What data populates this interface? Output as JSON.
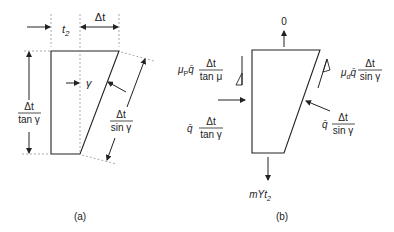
{
  "diagram": {
    "panel_a": {
      "caption": "(a)",
      "labels": {
        "t2_base": "t",
        "t2_sub": "2",
        "delta_t": "Δt",
        "gamma": "γ",
        "left_dim_num": "Δt",
        "left_dim_den": "tan γ",
        "right_dim_num": "Δt",
        "right_dim_den": "sin γ"
      }
    },
    "panel_b": {
      "caption": "(b)",
      "labels": {
        "top_force": "0",
        "mu_p_prefix": "μ",
        "mu_p_sub": "P",
        "qbar": "q̄",
        "mu_p_num": "Δt",
        "mu_p_den": "tan μ",
        "left_num": "Δt",
        "left_den": "tan γ",
        "mu_d_prefix": "μ",
        "mu_d_sub": "d",
        "mu_d_num": "Δt",
        "mu_d_den": "sin γ",
        "right_num": "Δt",
        "right_den": "sin γ",
        "bottom_force_base": "mYt",
        "bottom_force_sub": "2"
      }
    },
    "colors": {
      "line": "#222222",
      "dashed": "#777777",
      "background": "#ffffff"
    }
  }
}
